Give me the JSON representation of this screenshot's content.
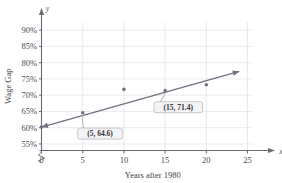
{
  "chart_data": {
    "type": "scatter",
    "title": "",
    "xlabel": "Years after 1980",
    "ylabel": "Wage Gap",
    "x_axis_name": "x",
    "y_axis_name": "y",
    "xlim": [
      0,
      27
    ],
    "ylim": [
      53,
      92.5
    ],
    "grid": true,
    "legend": "none",
    "x_ticks": [
      "0",
      "5",
      "10",
      "15",
      "20",
      "25"
    ],
    "x_tick_values": [
      0,
      5,
      10,
      15,
      20,
      25
    ],
    "y_ticks": [
      "55%",
      "60%",
      "65%",
      "70%",
      "75%",
      "80%",
      "85%",
      "90%"
    ],
    "y_tick_values": [
      55,
      60,
      65,
      70,
      75,
      80,
      85,
      90
    ],
    "y_axis_break": true,
    "x": [
      0,
      5,
      10,
      15,
      20
    ],
    "values": [
      60.2,
      64.6,
      71.8,
      71.4,
      73.2
    ],
    "series": [
      {
        "name": "Wage Gap data points",
        "x": [
          0,
          5,
          10,
          15,
          20
        ],
        "values": [
          60.2,
          64.6,
          71.8,
          71.4,
          73.2
        ]
      },
      {
        "name": "Trend line",
        "type": "line",
        "x": [
          0,
          24
        ],
        "values": [
          60.2,
          77.3
        ]
      }
    ],
    "annotations": [
      {
        "label": "(5, 64.6)",
        "point_x": 5,
        "point_y": 64.6,
        "box_x": 7.1,
        "box_y": 58.2
      },
      {
        "label": "(15, 71.4)",
        "point_x": 15,
        "point_y": 71.4,
        "box_x": 16.6,
        "box_y": 66.3
      }
    ],
    "colors": {
      "line": "#6e7180",
      "marker": "#6e7180",
      "grid": "#e2e2e6",
      "axis": "#6a6a72",
      "text": "#3e3e46",
      "callout_fill": "#f4f4f6",
      "callout_stroke": "#b9b9c2"
    }
  }
}
